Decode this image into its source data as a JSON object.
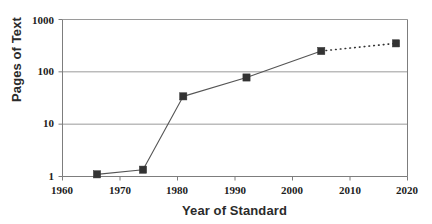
{
  "chart_data": {
    "type": "line",
    "title": "",
    "xlabel": "Year of Standard",
    "ylabel": "Pages of Text",
    "x": [
      1966,
      1974,
      1981,
      1992,
      2005,
      2018
    ],
    "values": [
      1.1,
      1.35,
      34,
      78,
      250,
      350
    ],
    "series": [
      {
        "name": "Pages of Text",
        "x": [
          1966,
          1974,
          1981,
          1992,
          2005,
          2018
        ],
        "values": [
          1.1,
          1.35,
          34,
          78,
          250,
          350
        ]
      }
    ],
    "xlim": [
      1960,
      2020
    ],
    "ylim": [
      1,
      1000
    ],
    "yscale": "log",
    "xscale": "linear",
    "x_ticks": [
      "1960",
      "1970",
      "1980",
      "1990",
      "2000",
      "2010",
      "2020"
    ],
    "x_tick_values": [
      1960,
      1970,
      1980,
      1990,
      2000,
      2010,
      2020
    ],
    "y_ticks": [
      "1",
      "10",
      "100",
      "1000"
    ],
    "y_tick_values": [
      1,
      10,
      100,
      1000
    ],
    "grid": "horizontal",
    "legend": "none",
    "marker": "square",
    "segment_styles": [
      "solid",
      "solid",
      "solid",
      "solid",
      "dotted"
    ],
    "colors": {
      "marker": "#333333",
      "line": "#555555",
      "grid": "#9a9a9a",
      "axis": "#7d7d7d",
      "text": "#1c1c1c",
      "title_text": "#2b2b2b",
      "background": "#ffffff"
    }
  },
  "axes": {
    "y_title": "Pages of Text",
    "x_title": "Year of Standard",
    "y_tick_labels": [
      "1000",
      "100",
      "10",
      "1"
    ],
    "x_tick_labels": [
      "1960",
      "1970",
      "1980",
      "1990",
      "2000",
      "2010",
      "2020"
    ]
  }
}
